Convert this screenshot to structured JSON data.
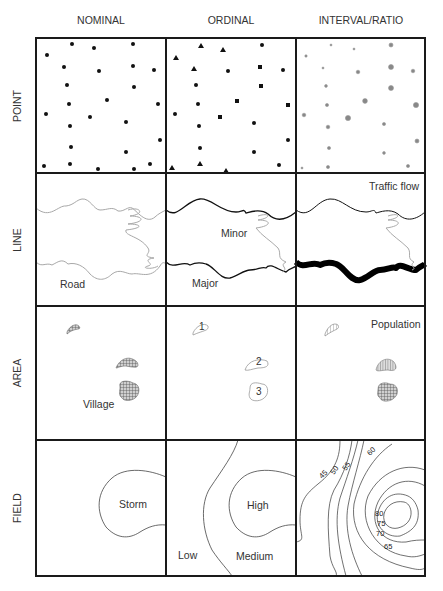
{
  "columns": [
    {
      "id": "nominal",
      "label": "NOMINAL"
    },
    {
      "id": "ordinal",
      "label": "ORDINAL"
    },
    {
      "id": "interval",
      "label": "INTERVAL/RATIO"
    }
  ],
  "rows": [
    {
      "id": "point",
      "label": "POINT"
    },
    {
      "id": "line",
      "label": "LINE"
    },
    {
      "id": "area",
      "label": "AREA"
    },
    {
      "id": "field",
      "label": "FIELD"
    }
  ],
  "cells": {
    "line_nominal_label": "Road",
    "line_ordinal_minor": "Minor",
    "line_ordinal_major": "Major",
    "line_interval_label": "Traffic flow",
    "area_nominal_label": "Village",
    "area_ordinal_ranks": [
      "1",
      "2",
      "3"
    ],
    "area_interval_label": "Population",
    "field_nominal_label": "Storm",
    "field_ordinal_high": "High",
    "field_ordinal_medium": "Medium",
    "field_ordinal_low": "Low",
    "field_interval_contours": [
      "45",
      "50",
      "55",
      "60",
      "65",
      "70",
      "75",
      "80"
    ]
  },
  "colors": {
    "grid": "#1a1a1a",
    "symbol": "#111111",
    "light_line": "#9a9a9a",
    "hatch": "#777777"
  }
}
